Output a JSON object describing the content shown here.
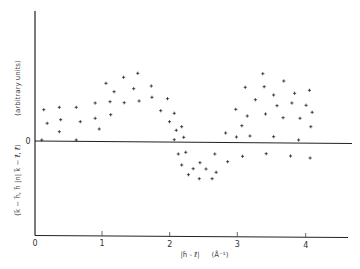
{
  "chart_data": {
    "type": "scatter",
    "title": "",
    "xlabel": "|h - ℓ|  (Å⁻¹)",
    "xlabel_parts": {
      "vector_expr": "|h⃗ - ℓ⃗|",
      "unit": "(Å⁻¹)"
    },
    "ylabel": "(k - h, h |n| k - ℓ, ℓ)   (arbitrary units)",
    "ylabel_parts": {
      "expr": "(k⃗ − h⃗, h⃗ |n| k⃗ − ℓ⃗, ℓ⃗)",
      "unit": "(arbitrary units)"
    },
    "xlim": [
      0,
      4.6
    ],
    "ylim": [
      -9.5,
      13
    ],
    "x_ticks": [
      0,
      1,
      2,
      3,
      4
    ],
    "x_tick_labels": [
      "0",
      "1",
      "2",
      "3",
      "4"
    ],
    "y_ticks": [
      0
    ],
    "y_tick_labels": [
      "0"
    ],
    "grid": false,
    "legend": null,
    "zero_line": true,
    "marker": "+",
    "points": [
      [
        0.13,
        3.23
      ],
      [
        0.36,
        3.47
      ],
      [
        0.61,
        3.47
      ],
      [
        0.89,
        3.9
      ],
      [
        0.18,
        1.87
      ],
      [
        0.38,
        2.23
      ],
      [
        0.67,
        2.03
      ],
      [
        0.89,
        2.37
      ],
      [
        0.36,
        1.03
      ],
      [
        0.95,
        1.3
      ],
      [
        0.1,
        0.2
      ],
      [
        0.61,
        0.2
      ],
      [
        1.05,
        5.87
      ],
      [
        1.31,
        6.47
      ],
      [
        1.52,
        6.87
      ],
      [
        1.17,
        5.03
      ],
      [
        1.46,
        5.33
      ],
      [
        1.72,
        5.6
      ],
      [
        1.11,
        4.03
      ],
      [
        1.32,
        3.93
      ],
      [
        1.54,
        4.1
      ],
      [
        1.73,
        4.47
      ],
      [
        1.96,
        4.33
      ],
      [
        1.12,
        2.73
      ],
      [
        1.86,
        3.13
      ],
      [
        1.99,
        2.03
      ],
      [
        2.06,
        2.87
      ],
      [
        2.17,
        1.53
      ],
      [
        2.09,
        1.17
      ],
      [
        2.2,
        0.47
      ],
      [
        2.06,
        0.23
      ],
      [
        2.12,
        -1.2
      ],
      [
        2.23,
        -1.03
      ],
      [
        2.66,
        -1.2
      ],
      [
        3.07,
        -1.43
      ],
      [
        2.17,
        -2.3
      ],
      [
        2.44,
        -2.07
      ],
      [
        2.85,
        -1.97
      ],
      [
        2.34,
        -2.67
      ],
      [
        2.53,
        -2.7
      ],
      [
        2.27,
        -3.27
      ],
      [
        2.68,
        -3.03
      ],
      [
        2.43,
        -3.67
      ],
      [
        2.62,
        -3.67
      ],
      [
        3.37,
        6.83
      ],
      [
        3.11,
        5.47
      ],
      [
        3.39,
        5.53
      ],
      [
        3.68,
        6.1
      ],
      [
        3.26,
        4.23
      ],
      [
        3.53,
        4.7
      ],
      [
        3.58,
        3.63
      ],
      [
        2.97,
        3.27
      ],
      [
        3.14,
        2.6
      ],
      [
        3.41,
        2.8
      ],
      [
        3.67,
        2.43
      ],
      [
        3.06,
        1.63
      ],
      [
        2.82,
        0.9
      ],
      [
        2.98,
        0.5
      ],
      [
        3.18,
        0.6
      ],
      [
        3.53,
        0.53
      ],
      [
        3.84,
        4.87
      ],
      [
        4.06,
        5.17
      ],
      [
        3.8,
        3.9
      ],
      [
        4.01,
        3.67
      ],
      [
        4.1,
        2.97
      ],
      [
        3.92,
        2.37
      ],
      [
        4.08,
        1.53
      ],
      [
        3.9,
        0.2
      ],
      [
        3.78,
        -1.4
      ],
      [
        4.07,
        -1.6
      ],
      [
        3.42,
        -1.17
      ]
    ],
    "colors": {
      "axis": "#222222",
      "marker": "#222222",
      "background": "#ffffff"
    }
  },
  "axes": {
    "x_label_expr": "|h⃗ - ℓ⃗|",
    "x_label_unit": "(Å⁻¹)",
    "y_label_expr": "(k⃗ − h⃗, h⃗ |n| k⃗ − ℓ⃗, ℓ⃗)",
    "y_label_unit": "(arbitrary units)",
    "y_zero_label": "0",
    "x_tick_labels": [
      "0",
      "1",
      "2",
      "3",
      "4"
    ]
  }
}
